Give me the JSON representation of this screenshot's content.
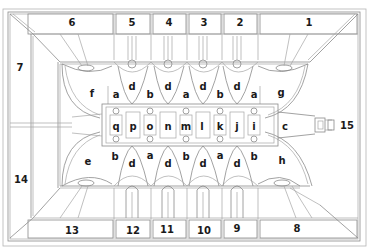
{
  "diagram": {
    "type": "architectural-ceiling-plan",
    "line_color": "#8a8a8a",
    "label_color": "#1a1a1a",
    "numbered_bays": [
      {
        "label": "1",
        "x": 309,
        "y": 23
      },
      {
        "label": "2",
        "x": 240,
        "y": 23
      },
      {
        "label": "3",
        "x": 204,
        "y": 23
      },
      {
        "label": "4",
        "x": 169,
        "y": 23
      },
      {
        "label": "5",
        "x": 132,
        "y": 23
      },
      {
        "label": "6",
        "x": 72,
        "y": 23
      },
      {
        "label": "7",
        "x": 20,
        "y": 68
      },
      {
        "label": "8",
        "x": 297,
        "y": 229
      },
      {
        "label": "9",
        "x": 237,
        "y": 229
      },
      {
        "label": "10",
        "x": 204,
        "y": 231
      },
      {
        "label": "11",
        "x": 167,
        "y": 230
      },
      {
        "label": "12",
        "x": 133,
        "y": 231
      },
      {
        "label": "13",
        "x": 72,
        "y": 231
      },
      {
        "label": "14",
        "x": 21,
        "y": 180
      },
      {
        "label": "15",
        "x": 347,
        "y": 126
      }
    ],
    "upper_letters": [
      {
        "label": "f",
        "x": 92,
        "y": 94
      },
      {
        "label": "a",
        "x": 116,
        "y": 95
      },
      {
        "label": "d",
        "x": 132,
        "y": 87
      },
      {
        "label": "b",
        "x": 150,
        "y": 95
      },
      {
        "label": "d",
        "x": 168,
        "y": 87
      },
      {
        "label": "a",
        "x": 186,
        "y": 95
      },
      {
        "label": "d",
        "x": 203,
        "y": 87
      },
      {
        "label": "b",
        "x": 220,
        "y": 95
      },
      {
        "label": "d",
        "x": 237,
        "y": 87
      },
      {
        "label": "a",
        "x": 254,
        "y": 95
      },
      {
        "label": "g",
        "x": 281,
        "y": 93
      }
    ],
    "nave_letters": [
      {
        "label": "q",
        "x": 116,
        "y": 127
      },
      {
        "label": "p",
        "x": 133,
        "y": 127
      },
      {
        "label": "o",
        "x": 150,
        "y": 127
      },
      {
        "label": "n",
        "x": 168,
        "y": 127
      },
      {
        "label": "m",
        "x": 186,
        "y": 127
      },
      {
        "label": "l",
        "x": 202,
        "y": 127
      },
      {
        "label": "k",
        "x": 220,
        "y": 127
      },
      {
        "label": "j",
        "x": 237,
        "y": 127
      },
      {
        "label": "i",
        "x": 254,
        "y": 127
      },
      {
        "label": "c",
        "x": 285,
        "y": 127
      }
    ],
    "lower_letters": [
      {
        "label": "e",
        "x": 88,
        "y": 162
      },
      {
        "label": "b",
        "x": 115,
        "y": 157
      },
      {
        "label": "d",
        "x": 132,
        "y": 164
      },
      {
        "label": "a",
        "x": 150,
        "y": 156
      },
      {
        "label": "d",
        "x": 168,
        "y": 164
      },
      {
        "label": "b",
        "x": 186,
        "y": 157
      },
      {
        "label": "d",
        "x": 203,
        "y": 164
      },
      {
        "label": "a",
        "x": 220,
        "y": 156
      },
      {
        "label": "d",
        "x": 237,
        "y": 164
      },
      {
        "label": "b",
        "x": 254,
        "y": 157
      },
      {
        "label": "h",
        "x": 282,
        "y": 161
      }
    ]
  }
}
